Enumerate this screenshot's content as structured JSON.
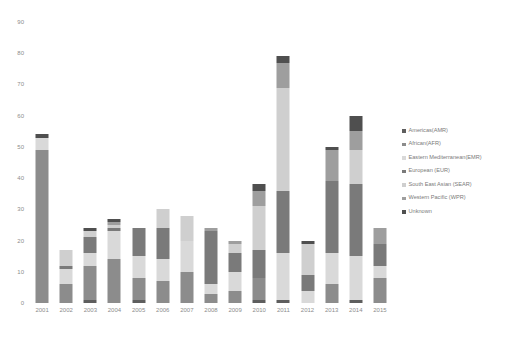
{
  "chart_data": {
    "type": "bar",
    "subtype": "stacked-bar",
    "title": "",
    "subtitle": "",
    "xlabel": "",
    "ylabel": "",
    "grid": false,
    "legend_position": "right",
    "ylim": [
      0,
      90
    ],
    "y_ticks": [
      0,
      10,
      20,
      30,
      40,
      50,
      60,
      70,
      80,
      90
    ],
    "categories": [
      "2001",
      "2002",
      "2003",
      "2004",
      "2005",
      "2006",
      "2007",
      "2008",
      "2009",
      "2010",
      "2011",
      "2012",
      "2013",
      "2014",
      "2015"
    ],
    "series": [
      {
        "name": "Americas(AMR)",
        "color": "#5e5e5e",
        "values": [
          0,
          0,
          1,
          0,
          1,
          0,
          0,
          0,
          0,
          1,
          1,
          0,
          0,
          1,
          0
        ]
      },
      {
        "name": "African(AFR)",
        "color": "#8c8c8c",
        "values": [
          49,
          6,
          11,
          14,
          7,
          7,
          10,
          3,
          4,
          7,
          0,
          0,
          6,
          0,
          8
        ]
      },
      {
        "name": "Eastern Mediterranean(EMR)",
        "color": "#d9d9d9",
        "values": [
          4,
          5,
          4,
          9,
          7,
          7,
          10,
          3,
          6,
          0,
          15,
          4,
          10,
          14,
          4
        ]
      },
      {
        "name": "European (EUR)",
        "color": "#7a7a7a",
        "values": [
          0,
          1,
          5,
          1,
          9,
          10,
          0,
          17,
          6,
          9,
          20,
          5,
          23,
          23,
          7
        ]
      },
      {
        "name": "South East Asian (SEAR)",
        "color": "#cfcfcf",
        "values": [
          0,
          5,
          2,
          1,
          0,
          6,
          8,
          0,
          3,
          14,
          33,
          10,
          0,
          11,
          0
        ]
      },
      {
        "name": "Western Pacific (WPR)",
        "color": "#9e9e9e",
        "values": [
          0,
          0,
          0,
          1,
          0,
          0,
          0,
          1,
          1,
          5,
          8,
          0,
          10,
          6,
          5
        ]
      },
      {
        "name": "Unknown",
        "color": "#4f4f4f",
        "values": [
          1,
          0,
          1,
          1,
          0,
          0,
          0,
          0,
          0,
          2,
          2,
          1,
          1,
          5,
          0
        ]
      }
    ],
    "totals": [
      54,
      17,
      24,
      27,
      24,
      30,
      28,
      24,
      20,
      38,
      79,
      20,
      50,
      60,
      24
    ]
  },
  "legend": {
    "items": [
      {
        "label": "Americas(AMR)",
        "color": "#5e5e5e"
      },
      {
        "label": "African(AFR)",
        "color": "#8c8c8c"
      },
      {
        "label": "Eastern Mediterranean(EMR)",
        "color": "#d9d9d9"
      },
      {
        "label": "European (EUR)",
        "color": "#7a7a7a"
      },
      {
        "label": "South East Asian (SEAR)",
        "color": "#cfcfcf"
      },
      {
        "label": "Western Pacific (WPR)",
        "color": "#9e9e9e"
      },
      {
        "label": "Unknown",
        "color": "#4f4f4f"
      }
    ]
  }
}
